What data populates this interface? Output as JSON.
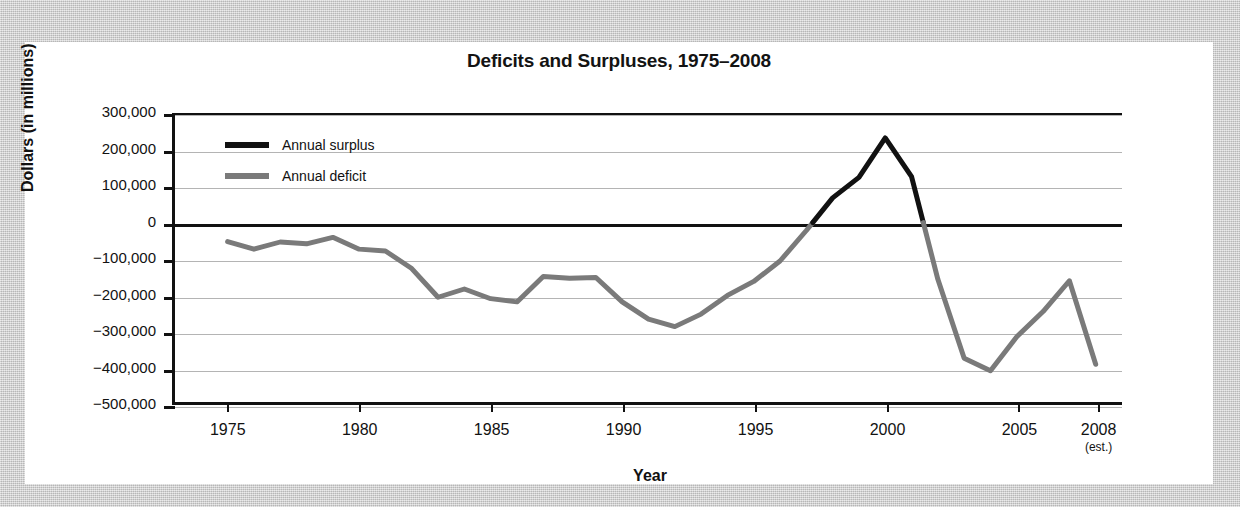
{
  "figure": {
    "title": "Deficits and Surpluses, 1975–2008"
  },
  "legend": {
    "position": "top-left-inside",
    "items": [
      {
        "label": "Annual surplus",
        "color": "#111111",
        "name": "annual-surplus"
      },
      {
        "label": "Annual deficit",
        "color": "#7a7a7a",
        "name": "annual-deficit"
      }
    ]
  },
  "axes": {
    "x": {
      "label": "Year",
      "ticks": [
        {
          "value": 1975,
          "text": "1975",
          "sub": ""
        },
        {
          "value": 1980,
          "text": "1980",
          "sub": ""
        },
        {
          "value": 1985,
          "text": "1985",
          "sub": ""
        },
        {
          "value": 1990,
          "text": "1990",
          "sub": ""
        },
        {
          "value": 1995,
          "text": "1995",
          "sub": ""
        },
        {
          "value": 2000,
          "text": "2000",
          "sub": ""
        },
        {
          "value": 2005,
          "text": "2005",
          "sub": ""
        },
        {
          "value": 2008,
          "text": "2008",
          "sub": "(est.)"
        }
      ],
      "min": 1973,
      "max": 2009
    },
    "y": {
      "label": "Dollars (in millions)",
      "ticks": [
        {
          "value": 300000,
          "text": "300,000"
        },
        {
          "value": 200000,
          "text": "200,000"
        },
        {
          "value": 100000,
          "text": "100,000"
        },
        {
          "value": 0,
          "text": "0"
        },
        {
          "value": -100000,
          "text": "−100,000"
        },
        {
          "value": -200000,
          "text": "−200,000"
        },
        {
          "value": -300000,
          "text": "−300,000"
        },
        {
          "value": -400000,
          "text": "−400,000"
        },
        {
          "value": -500000,
          "text": "−500,000"
        }
      ],
      "min": -500000,
      "max": 300000
    }
  },
  "chart_data": {
    "type": "line",
    "title": "Deficits and Surpluses, 1975–2008",
    "xlabel": "Year",
    "ylabel": "Dollars (in millions)",
    "xlim": [
      1973,
      2009
    ],
    "ylim": [
      -500000,
      300000
    ],
    "grid": true,
    "legend_position": "top-left-inside",
    "x": [
      1975,
      1976,
      1977,
      1978,
      1979,
      1980,
      1981,
      1982,
      1983,
      1984,
      1985,
      1986,
      1987,
      1988,
      1989,
      1990,
      1991,
      1992,
      1993,
      1994,
      1995,
      1996,
      1997,
      1998,
      1999,
      2000,
      2001,
      2002,
      2003,
      2004,
      2005,
      2006,
      2007,
      2008
    ],
    "series": [
      {
        "name": "Annual deficit / surplus",
        "color_deficit": "#7a7a7a",
        "color_surplus": "#111111",
        "values": [
          -53000,
          -74000,
          -54000,
          -59000,
          -41000,
          -74000,
          -79000,
          -128000,
          -208000,
          -185000,
          -212000,
          -221000,
          -150000,
          -155000,
          -153000,
          -221000,
          -269000,
          -290000,
          -255000,
          -203000,
          -164000,
          -107000,
          -22000,
          69000,
          126000,
          236000,
          128000,
          -158000,
          -378000,
          -413000,
          -318000,
          -248000,
          -162000,
          -395000
        ]
      }
    ],
    "annotations": [
      {
        "text": "Peak surplus near 2000",
        "x": 2000,
        "y": 236000
      },
      {
        "text": "2008 value is an estimate",
        "x": 2008,
        "y": -395000
      }
    ]
  }
}
